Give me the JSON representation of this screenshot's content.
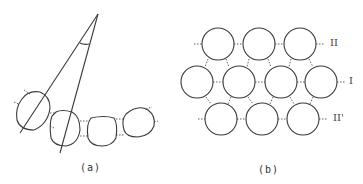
{
  "panels": [
    {
      "id": "a",
      "caption": "(a)",
      "description": "Four rounded cells in a curved row with two radial lines converging to an apex, angle arc marked"
    },
    {
      "id": "b",
      "caption": "(b)",
      "description": "Hexagonally packed circles in three rows with row labels"
    }
  ],
  "row_labels": {
    "top": "II",
    "middle": "I",
    "bottom": "II'"
  },
  "colors": {
    "stroke": "#3a3a3a",
    "background": "#ffffff"
  }
}
